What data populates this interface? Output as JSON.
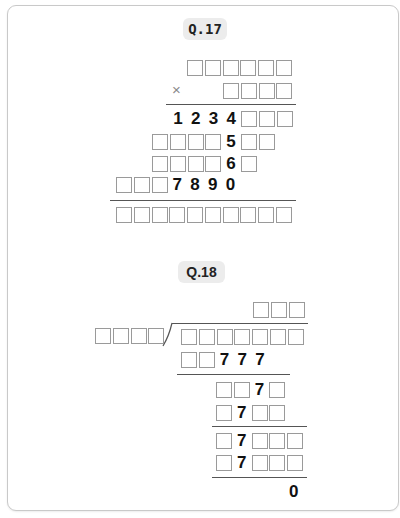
{
  "q17": {
    "label": "Q.17",
    "operator": "×",
    "rows": [
      {
        "cells": [
          "",
          "",
          "",
          "",
          "",
          ""
        ]
      },
      {
        "cells": [
          "",
          "",
          "",
          ""
        ]
      },
      {
        "cells": [
          "1",
          "2",
          "3",
          "4",
          "",
          "",
          ""
        ]
      },
      {
        "cells": [
          "",
          "",
          "",
          "",
          "5",
          "",
          ""
        ]
      },
      {
        "cells": [
          "",
          "",
          "",
          "",
          "6",
          ""
        ]
      },
      {
        "cells": [
          "",
          "",
          "",
          "7",
          "8",
          "9",
          "0"
        ]
      },
      {
        "cells": [
          "",
          "",
          "",
          "",
          "",
          "",
          "",
          "",
          "",
          ""
        ]
      }
    ]
  },
  "q18": {
    "label": "Q.18",
    "quotient": [
      "",
      "",
      ""
    ],
    "divisor": [
      "",
      "",
      "",
      ""
    ],
    "dividend": [
      "",
      "",
      "",
      "",
      "",
      "",
      ""
    ],
    "steps": [
      {
        "cells": [
          "",
          "",
          "7",
          "7",
          "7"
        ]
      },
      {
        "cells": [
          "",
          "",
          "7",
          ""
        ]
      },
      {
        "cells": [
          "",
          "7",
          "",
          ""
        ]
      },
      {
        "cells": [
          "",
          "7",
          "",
          "",
          ""
        ]
      },
      {
        "cells": [
          "",
          "7",
          "",
          "",
          ""
        ]
      }
    ],
    "remainder": "0"
  },
  "colors": {
    "box_border": "#9a9a9a",
    "badge_bg": "#ececec",
    "rule": "#555555"
  }
}
